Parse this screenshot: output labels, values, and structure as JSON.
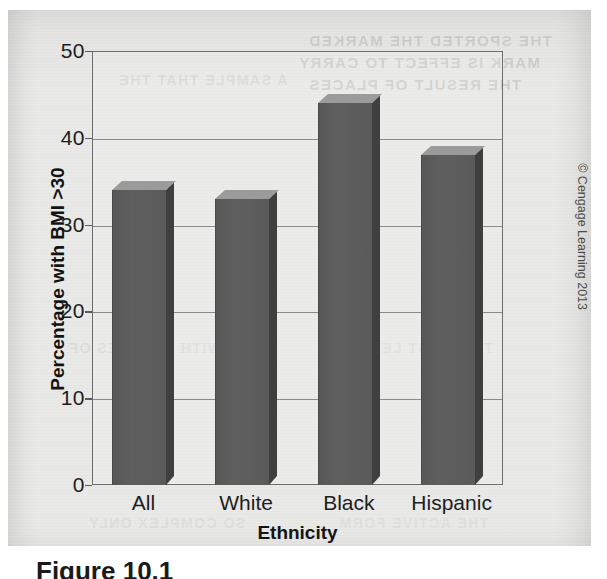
{
  "chart_data": {
    "type": "bar",
    "title": "",
    "categories": [
      "All",
      "White",
      "Black",
      "Hispanic"
    ],
    "values": [
      34,
      33,
      44,
      38
    ],
    "xlabel": "Ethnicity",
    "ylabel": "Percentage with BMI >30",
    "ylim": [
      0,
      50
    ],
    "yticks": [
      0,
      10,
      20,
      30,
      40,
      50
    ],
    "ytick_labels": [
      "0",
      "10",
      "20",
      "30",
      "40",
      "50"
    ],
    "grid": true,
    "legend": false,
    "series": [
      {
        "name": "Percentage with BMI >30",
        "values": [
          34,
          33,
          44,
          38
        ]
      }
    ],
    "bar_color": "#5a5a5a",
    "bar_top_color": "#9b9b9b",
    "bar_side_color": "#3f3f40"
  },
  "figure": {
    "credit": "© Cengage Learning 2013",
    "caption": "Figure 10.1",
    "page_background": "#e9e9e7",
    "axis_color": "#6d6d6d",
    "text_color": "#1d1d1d"
  },
  "bleed_through": [
    "THE SPORTED THE MARKED",
    "MARK IS EFFECT TO CARRY",
    "THE RESULT OF PLACES",
    "A SAMPLE THAT THE",
    "WITH IN CASES OF",
    "THE FIRST LEVELS",
    "SO COMPLEX ONLY",
    "THE ACTIVE FORM"
  ]
}
